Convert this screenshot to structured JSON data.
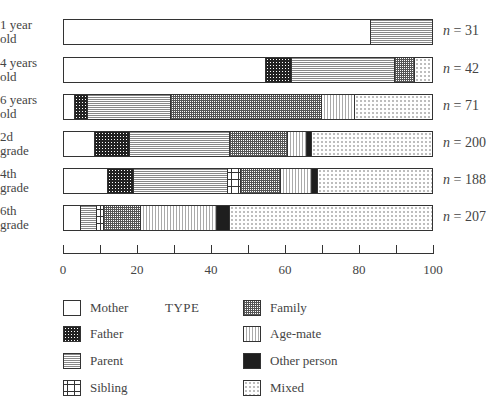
{
  "chart_data": {
    "type": "bar",
    "orientation": "horizontal",
    "stacked": true,
    "percent": true,
    "title": "",
    "xlabel": "",
    "ylabel": "",
    "xlim": [
      0,
      100
    ],
    "x_ticks": [
      0,
      20,
      40,
      60,
      80,
      100
    ],
    "legend_title": "TYPE",
    "legend_position": "bottom",
    "categories": [
      "1 year old",
      "4 years old",
      "6 years old",
      "2d grade",
      "4th grade",
      "6th grade"
    ],
    "sample_sizes": [
      "n = 31",
      "n = 42",
      "n = 71",
      "n = 200",
      "n = 188",
      "n = 207"
    ],
    "series": [
      {
        "name": "Mother",
        "values": [
          83.5,
          55.0,
          3.0,
          8.5,
          12.0,
          4.5
        ]
      },
      {
        "name": "Father",
        "values": [
          0,
          7.0,
          3.5,
          9.5,
          7.0,
          0
        ]
      },
      {
        "name": "Parent",
        "values": [
          16.5,
          28.0,
          22.5,
          27.0,
          25.5,
          4.5
        ]
      },
      {
        "name": "Sibling",
        "values": [
          0,
          0,
          0,
          0,
          3.5,
          2.0
        ]
      },
      {
        "name": "Family",
        "values": [
          0,
          5.5,
          41.0,
          16.0,
          11.0,
          10.0
        ]
      },
      {
        "name": "Age-mate",
        "values": [
          0,
          0,
          9.0,
          5.0,
          8.5,
          20.5
        ]
      },
      {
        "name": "Other person",
        "values": [
          0,
          0,
          0,
          1.5,
          1.5,
          3.5
        ]
      },
      {
        "name": "Mixed",
        "values": [
          0,
          4.5,
          21.0,
          32.5,
          31.0,
          55.0
        ]
      }
    ]
  },
  "rows": [
    {
      "label_line1": "1 year",
      "label_line2": "old",
      "n_prefix": "n",
      "n_value": " = 31"
    },
    {
      "label_line1": "4 years",
      "label_line2": "old",
      "n_prefix": "n",
      "n_value": " = 42"
    },
    {
      "label_line1": "6 years",
      "label_line2": "old",
      "n_prefix": "n",
      "n_value": " = 71"
    },
    {
      "label_line1": "2d",
      "label_line2": "grade",
      "n_prefix": "n",
      "n_value": " = 200"
    },
    {
      "label_line1": "4th",
      "label_line2": "grade",
      "n_prefix": "n",
      "n_value": " = 188"
    },
    {
      "label_line1": "6th",
      "label_line2": "grade",
      "n_prefix": "n",
      "n_value": " = 207"
    }
  ],
  "axis": {
    "ticks": [
      "0",
      "20",
      "40",
      "60",
      "80",
      "100"
    ]
  },
  "legend": {
    "title": "TYPE",
    "items": [
      {
        "label": "Mother",
        "pattern": "p-mother"
      },
      {
        "label": "Father",
        "pattern": "p-father"
      },
      {
        "label": "Parent",
        "pattern": "p-parent"
      },
      {
        "label": "Sibling",
        "pattern": "p-sibling"
      },
      {
        "label": "Family",
        "pattern": "p-family"
      },
      {
        "label": "Age-mate",
        "pattern": "p-agemate"
      },
      {
        "label": "Other person",
        "pattern": "p-other"
      },
      {
        "label": "Mixed",
        "pattern": "p-mixed"
      }
    ]
  }
}
